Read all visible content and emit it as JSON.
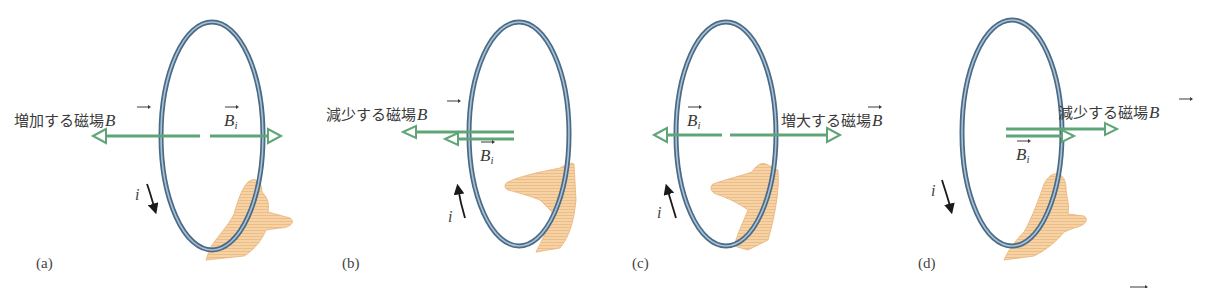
{
  "figure": {
    "colors": {
      "ring_outer": "#4a6a86",
      "ring_inner": "#a9c2d6",
      "field_arrow": "#5fa578",
      "hand_fill": "#f4c995",
      "hand_stroke": "#e0a86a",
      "current_arrow": "#1a1a1a",
      "text": "#3a3a3a"
    },
    "panels": [
      {
        "id": "(a)",
        "field_label": "増加する磁場",
        "field_symbol": "B",
        "induced_symbol": "B",
        "induced_subscript": "i",
        "current_symbol": "i",
        "current_direction": "down"
      },
      {
        "id": "(b)",
        "field_label": "減少する磁場",
        "field_symbol": "B",
        "induced_symbol": "B",
        "induced_subscript": "i",
        "current_symbol": "i",
        "current_direction": "up"
      },
      {
        "id": "(c)",
        "field_label": "増大する磁場",
        "field_symbol": "B",
        "induced_symbol": "B",
        "induced_subscript": "i",
        "current_symbol": "i",
        "current_direction": "up"
      },
      {
        "id": "(d)",
        "field_label": "減少する磁場",
        "field_symbol": "B",
        "induced_symbol": "B",
        "induced_subscript": "i",
        "current_symbol": "i",
        "current_direction": "down"
      }
    ]
  }
}
